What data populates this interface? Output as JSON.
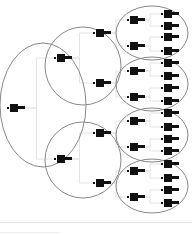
{
  "diagram": {
    "type": "tree",
    "colors": {
      "node": "#111111",
      "ellipse_stroke": "#888888",
      "edge": "#e4e4e4",
      "background": "#ffffff"
    },
    "groups": [
      {
        "id": "g0",
        "cx": 43,
        "cy": 105,
        "rx": 43,
        "ry": 62
      },
      {
        "id": "g1a",
        "cx": 83,
        "cy": 66,
        "rx": 38,
        "ry": 39
      },
      {
        "id": "g1b",
        "cx": 83,
        "cy": 160,
        "rx": 38,
        "ry": 38
      },
      {
        "id": "g2a",
        "cx": 152,
        "cy": 33,
        "rx": 36,
        "ry": 27
      },
      {
        "id": "g2b",
        "cx": 152,
        "cy": 84,
        "rx": 36,
        "ry": 27
      },
      {
        "id": "g2c",
        "cx": 152,
        "cy": 135,
        "rx": 36,
        "ry": 27
      },
      {
        "id": "g2d",
        "cx": 152,
        "cy": 186,
        "rx": 36,
        "ry": 27
      }
    ],
    "nodes": [
      {
        "id": "n0",
        "x": 10,
        "y": 108,
        "level": 0
      },
      {
        "id": "n1",
        "x": 57,
        "y": 58,
        "level": 1,
        "parent": "n0"
      },
      {
        "id": "n2",
        "x": 57,
        "y": 159,
        "level": 1,
        "parent": "n0"
      },
      {
        "id": "n3",
        "x": 96,
        "y": 33,
        "level": 2,
        "parent": "n1"
      },
      {
        "id": "n4",
        "x": 96,
        "y": 83,
        "level": 2,
        "parent": "n1"
      },
      {
        "id": "n5",
        "x": 96,
        "y": 133,
        "level": 2,
        "parent": "n2"
      },
      {
        "id": "n6",
        "x": 96,
        "y": 183,
        "level": 2,
        "parent": "n2"
      },
      {
        "id": "n7",
        "x": 130,
        "y": 20,
        "level": 3,
        "parent": "n3"
      },
      {
        "id": "n8",
        "x": 130,
        "y": 46,
        "level": 3,
        "parent": "n3"
      },
      {
        "id": "n9",
        "x": 130,
        "y": 71,
        "level": 3,
        "parent": "n4"
      },
      {
        "id": "n10",
        "x": 130,
        "y": 97,
        "level": 3,
        "parent": "n4"
      },
      {
        "id": "n11",
        "x": 130,
        "y": 121,
        "level": 3,
        "parent": "n5"
      },
      {
        "id": "n12",
        "x": 130,
        "y": 147,
        "level": 3,
        "parent": "n5"
      },
      {
        "id": "n13",
        "x": 130,
        "y": 171,
        "level": 3,
        "parent": "n6"
      },
      {
        "id": "n14",
        "x": 130,
        "y": 197,
        "level": 3,
        "parent": "n6"
      },
      {
        "id": "n15",
        "x": 164,
        "y": 14,
        "level": 4,
        "parent": "n7"
      },
      {
        "id": "n16",
        "x": 164,
        "y": 26,
        "level": 4,
        "parent": "n7"
      },
      {
        "id": "n17",
        "x": 164,
        "y": 37,
        "level": 4,
        "parent": "n8"
      },
      {
        "id": "n18",
        "x": 164,
        "y": 51,
        "level": 4,
        "parent": "n8"
      },
      {
        "id": "n19",
        "x": 164,
        "y": 63,
        "level": 4,
        "parent": "n9"
      },
      {
        "id": "n20",
        "x": 164,
        "y": 76,
        "level": 4,
        "parent": "n9"
      },
      {
        "id": "n21",
        "x": 164,
        "y": 88,
        "level": 4,
        "parent": "n10"
      },
      {
        "id": "n22",
        "x": 164,
        "y": 101,
        "level": 4,
        "parent": "n10"
      },
      {
        "id": "n23",
        "x": 164,
        "y": 113,
        "level": 4,
        "parent": "n11"
      },
      {
        "id": "n24",
        "x": 164,
        "y": 127,
        "level": 4,
        "parent": "n11"
      },
      {
        "id": "n25",
        "x": 164,
        "y": 139,
        "level": 4,
        "parent": "n12"
      },
      {
        "id": "n26",
        "x": 164,
        "y": 151,
        "level": 4,
        "parent": "n12"
      },
      {
        "id": "n27",
        "x": 164,
        "y": 164,
        "level": 4,
        "parent": "n13"
      },
      {
        "id": "n28",
        "x": 164,
        "y": 178,
        "level": 4,
        "parent": "n13"
      },
      {
        "id": "n29",
        "x": 164,
        "y": 190,
        "level": 4,
        "parent": "n14"
      },
      {
        "id": "n30",
        "x": 164,
        "y": 203,
        "level": 4,
        "parent": "n14"
      }
    ]
  }
}
